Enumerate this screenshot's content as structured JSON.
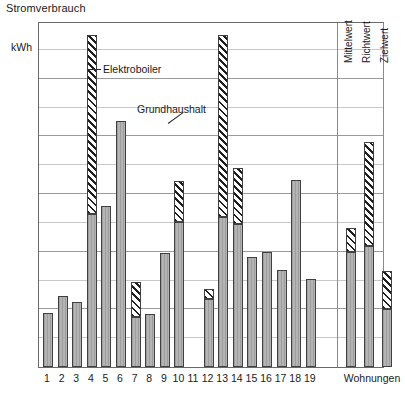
{
  "chart_data": {
    "type": "bar",
    "title": "Stromverbrauch",
    "ylabel": "kWh",
    "xlabel": "",
    "ylim": [
      0,
      3000
    ],
    "ytick_step": 500,
    "minor_gridline_step": 250,
    "grid": true,
    "stacked": true,
    "legend_position": "inline-annotations",
    "series": [
      {
        "name": "Grundhaushalt",
        "values": [
          470,
          615,
          565,
          1325,
          1395,
          2135,
          430,
          460,
          985,
          1260,
          0,
          590,
          1300,
          1240,
          955,
          1000,
          845,
          1620,
          760
        ]
      },
      {
        "name": "Elektroboiler",
        "values": [
          0,
          0,
          0,
          1555,
          0,
          0,
          305,
          0,
          0,
          350,
          0,
          90,
          1580,
          490,
          0,
          0,
          0,
          0,
          0
        ]
      }
    ],
    "categories": [
      "1",
      "2",
      "3",
      "4",
      "5",
      "6",
      "7",
      "8",
      "9",
      "10",
      "11",
      "12",
      "13",
      "14",
      "15",
      "16",
      "17",
      "18",
      "19"
    ],
    "totals": [
      470,
      615,
      565,
      2880,
      1395,
      2135,
      735,
      460,
      985,
      1610,
      480,
      680,
      2880,
      1730,
      955,
      1000,
      845,
      1620,
      760
    ],
    "note_bar11": {
      "Grundhaushalt": 480,
      "Elektroboiler": 0
    },
    "summary_group": {
      "group_label": "Wohnungen",
      "categories": [
        "Mittelwert",
        "Richtwert",
        "Zielwert"
      ],
      "series": [
        {
          "name": "Grundhaushalt",
          "values": [
            1000,
            1050,
            500
          ]
        },
        {
          "name": "Elektroboiler",
          "values": [
            205,
            900,
            330
          ]
        }
      ],
      "totals": [
        1205,
        1950,
        830
      ]
    },
    "annotations": [
      {
        "text": "Elektroboiler",
        "target_category": "4"
      },
      {
        "text": "Grundhaushalt",
        "target_category": "6"
      }
    ],
    "ytick_labels": [
      "3000",
      "2500",
      "2000",
      "1500",
      "1000",
      "500",
      "0"
    ],
    "ytick_values": [
      3000,
      2500,
      2000,
      1500,
      1000,
      500,
      0
    ]
  },
  "annotations": {
    "elektroboiler": "Elektroboiler",
    "grundhaushalt": "Grundhaushalt"
  },
  "axis": {
    "unit": "kWh",
    "group_label": "Wohnungen"
  },
  "summary_labels": {
    "mittelwert": "Mittelwert",
    "richtwert": "Richtwert",
    "zielwert": "Zielwert"
  },
  "colors": {
    "base_fill": "#b0b0b0",
    "hatch_fg": "#1f1f1f",
    "hatch_bg": "#ffffff",
    "border": "#404040",
    "grid_major": "#9a9a9a",
    "grid_minor": "#c8c8c8",
    "text": "#1a1a1a"
  }
}
